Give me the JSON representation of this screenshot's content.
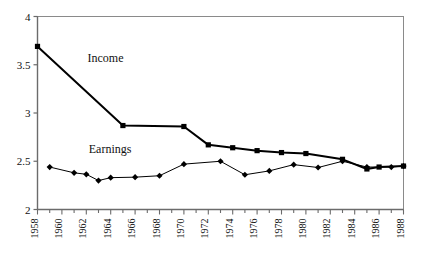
{
  "chart_data": {
    "type": "line",
    "title": "",
    "xlabel": "",
    "ylabel": "",
    "xlim": [
      1958,
      1988
    ],
    "ylim": [
      2,
      4
    ],
    "grid": false,
    "legend": "inline-annotations",
    "yticks": [
      "2",
      "2.5",
      "3",
      "3.5",
      "4"
    ],
    "ytick_values": [
      2,
      2.5,
      3,
      3.5,
      4
    ],
    "xticks": [
      "1958",
      "1960",
      "1962",
      "1964",
      "1966",
      "1968",
      "1970",
      "1972",
      "1974",
      "1976",
      "1978",
      "1980",
      "1982",
      "1984",
      "1986",
      "1988"
    ],
    "xtick_values": [
      1958,
      1960,
      1962,
      1964,
      1966,
      1968,
      1970,
      1972,
      1974,
      1976,
      1978,
      1980,
      1982,
      1984,
      1986,
      1988
    ],
    "xminor_step": 1,
    "series": [
      {
        "name": "Income",
        "marker": "square",
        "color": "#000000",
        "line_width": 2,
        "x": [
          1958,
          1965,
          1970,
          1972,
          1974,
          1976,
          1978,
          1980,
          1983,
          1985,
          1986,
          1988
        ],
        "values": [
          3.69,
          2.87,
          2.86,
          2.67,
          2.64,
          2.61,
          2.59,
          2.58,
          2.52,
          2.42,
          2.44,
          2.45
        ]
      },
      {
        "name": "Earnings",
        "marker": "diamond",
        "color": "#000000",
        "line_width": 1,
        "x": [
          1959,
          1961,
          1962,
          1963,
          1964,
          1966,
          1968,
          1970,
          1973,
          1975,
          1977,
          1979,
          1981,
          1983,
          1985,
          1987,
          1988
        ],
        "values": [
          2.44,
          2.38,
          2.365,
          2.3,
          2.33,
          2.335,
          2.35,
          2.47,
          2.5,
          2.36,
          2.4,
          2.465,
          2.435,
          2.5,
          2.44,
          2.44,
          2.45
        ]
      }
    ],
    "annotations": [
      {
        "text": "Income",
        "x": 1962.1,
        "y": 3.53
      },
      {
        "text": "Earnings",
        "x": 1962.2,
        "y": 2.585
      }
    ]
  }
}
